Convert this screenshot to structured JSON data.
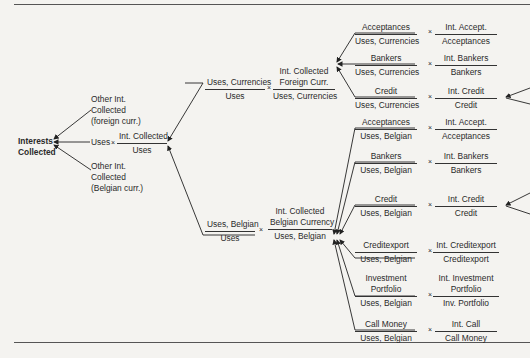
{
  "title": "Interests Collected",
  "colors": {
    "background": "#f4f3f0",
    "ink": "#2a2a2a",
    "rule": "#555555"
  },
  "root": {
    "label": "Interests Collected"
  },
  "level1": {
    "other_foreign": "Other Int. Collected (foreign curr.)",
    "other_foreign_lines": [
      "Other Int.",
      "Collected",
      "(foreign curr.)"
    ],
    "uses_term": "Uses",
    "multiply": "×",
    "ratio": {
      "num": "Int. Collected",
      "den": "Uses"
    },
    "other_belgian_lines": [
      "Other Int.",
      "Collected",
      "(Belgian curr.)"
    ]
  },
  "level2": {
    "currencies": {
      "share": {
        "num": "Uses, Currencies",
        "den": "Uses"
      },
      "rate": {
        "num_lines": [
          "Int. Collected",
          "Foreign Curr."
        ],
        "den": "Uses, Currencies"
      }
    },
    "belgian": {
      "share": {
        "num": "Uses, Belgian",
        "den": "Uses"
      },
      "rate": {
        "num_lines": [
          "Int. Collected",
          "Belgian Currency"
        ],
        "den": "Uses, Belgian"
      }
    }
  },
  "level3": {
    "currencies": [
      {
        "share_num": "Acceptances",
        "share_den": "Uses, Currencies",
        "rate_num": "Int. Accept.",
        "rate_den": "Acceptances"
      },
      {
        "share_num": "Bankers",
        "share_den": "Uses, Currencies",
        "rate_num": "Int. Bankers",
        "rate_den": "Bankers"
      },
      {
        "share_num": "Credit",
        "share_den": "Uses, Currencies",
        "rate_num": "Int. Credit",
        "rate_den": "Credit"
      }
    ],
    "belgian": [
      {
        "share_num": "Acceptances",
        "share_den": "Uses, Belgian",
        "rate_num": "Int. Accept.",
        "rate_den": "Acceptances"
      },
      {
        "share_num": "Bankers",
        "share_den": "Uses, Belgian",
        "rate_num": "Int. Bankers",
        "rate_den": "Bankers"
      },
      {
        "share_num": "Credit",
        "share_den": "Uses, Belgian",
        "rate_num": "Int. Credit",
        "rate_den": "Credit"
      },
      {
        "share_num": "Creditexport",
        "share_den": "Uses, Belgian",
        "rate_num": "Int. Creditexport",
        "rate_den": "Creditexport"
      },
      {
        "share_num_lines": [
          "Investment",
          "Portfolio"
        ],
        "share_den": "Uses, Belgian",
        "rate_num_lines": [
          "Int. Investment",
          "Portfolio"
        ],
        "rate_den": "Inv. Portfolio"
      },
      {
        "share_num": "Call Money",
        "share_den": "Uses, Belgian",
        "rate_num": "Int. Call",
        "rate_den": "Call Money"
      }
    ]
  }
}
